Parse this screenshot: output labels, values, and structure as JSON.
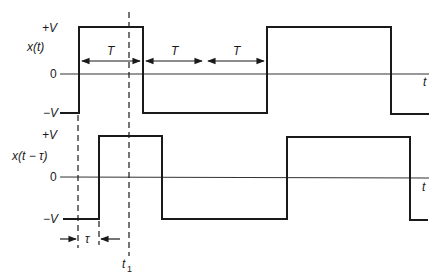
{
  "figure": {
    "colors": {
      "stroke": "#1a1a1a",
      "background": "#ffffff"
    },
    "top_plot": {
      "signal_label": "x(t)",
      "level_high": "+V",
      "level_zero": "0",
      "level_low": "−V",
      "time_axis_label": "t",
      "period_labels": [
        "T",
        "T",
        "T"
      ]
    },
    "bottom_plot": {
      "signal_label": "x(t − τ)",
      "level_high": "+V",
      "level_zero": "0",
      "level_low": "−V",
      "time_axis_label": "t"
    },
    "annotations": {
      "delay_label": "τ",
      "time_marker_label": "t",
      "time_marker_subscript": "1"
    }
  }
}
